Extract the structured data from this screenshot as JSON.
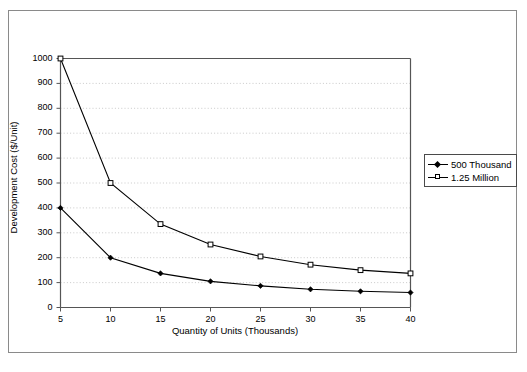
{
  "chart_data": {
    "type": "line",
    "title": "",
    "xlabel": "Quantity of Units (Thousands)",
    "ylabel": "Development Cost ($/Unit)",
    "x": [
      5,
      10,
      15,
      20,
      25,
      30,
      35,
      40
    ],
    "xticklabels": [
      "5",
      "10",
      "15",
      "20",
      "25",
      "30",
      "35",
      "40"
    ],
    "yticklabels": [
      "0",
      "100",
      "200",
      "300",
      "400",
      "500",
      "600",
      "700",
      "800",
      "900",
      "1000"
    ],
    "yticks": [
      0,
      100,
      200,
      300,
      400,
      500,
      600,
      700,
      800,
      900,
      1000
    ],
    "xlim": [
      5,
      40
    ],
    "ylim": [
      0,
      1000
    ],
    "grid": "horizontal-dotted",
    "legend_position": "right-outside",
    "series": [
      {
        "name": "500 Thousand",
        "marker": "filled-diamond",
        "values": [
          400,
          200,
          137,
          105,
          87,
          73,
          65,
          60
        ]
      },
      {
        "name": "1.25 Million",
        "marker": "open-square",
        "values": [
          1000,
          500,
          335,
          253,
          205,
          172,
          150,
          137
        ]
      }
    ]
  },
  "legend": {
    "items": [
      {
        "label": "500 Thousand",
        "marker": "filled-diamond"
      },
      {
        "label": "1.25 Million",
        "marker": "open-square"
      }
    ]
  },
  "colors": {
    "line": "#000000",
    "grid": "#bdbdbd",
    "axis": "#555555",
    "frame": "#8a8a8a",
    "background": "#ffffff"
  }
}
